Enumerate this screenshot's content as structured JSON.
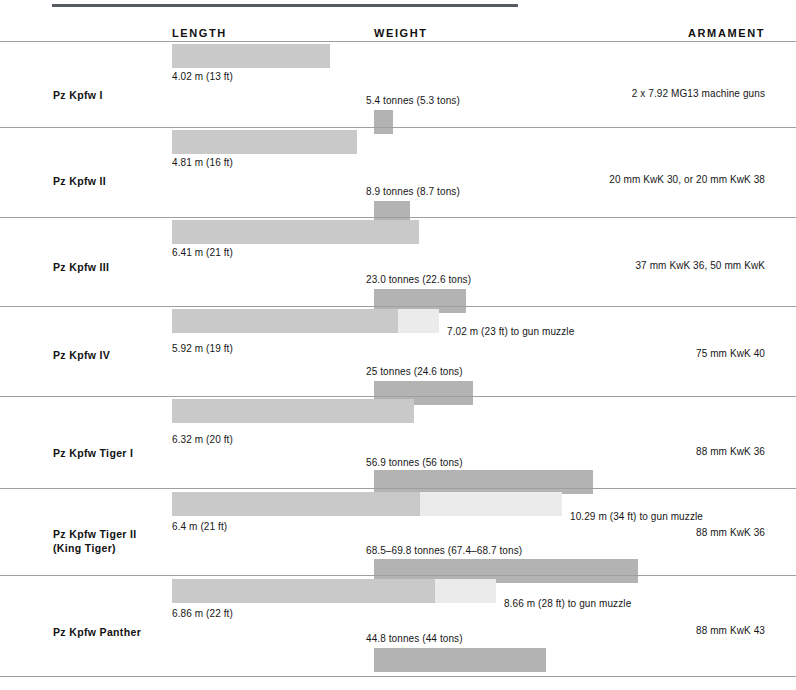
{
  "headers": {
    "length": "LENGTH",
    "weight": "WEIGHT",
    "armament": "ARMAMENT"
  },
  "chart_data": {
    "type": "bar",
    "title": "",
    "xlabel": "",
    "ylabel": "",
    "categories": [
      "Pz Kpfw I",
      "Pz Kpfw II",
      "Pz Kpfw III",
      "Pz Kpfw IV",
      "Pz Kpfw Tiger I",
      "Pz Kpfw Tiger II\n(King Tiger)",
      "Pz Kpfw Panther"
    ],
    "series": [
      {
        "name": "Length (m)",
        "values": [
          4.02,
          4.81,
          6.41,
          5.92,
          6.32,
          6.4,
          6.86
        ]
      },
      {
        "name": "Length to gun muzzle (m)",
        "values": [
          null,
          null,
          null,
          7.02,
          null,
          10.29,
          8.66
        ]
      },
      {
        "name": "Weight (tonnes)",
        "values": [
          5.4,
          8.9,
          23.0,
          25,
          56.9,
          69.15,
          44.8
        ]
      }
    ],
    "legend_position": "none",
    "grid": false
  },
  "rows": [
    {
      "name": "Pz Kpfw I",
      "length_label": "4.02 m (13 ft)",
      "length_ext_label": "",
      "weight_label": "5.4 tonnes (5.3 tons)",
      "armament": "2 x  7.92 MG13 machine guns"
    },
    {
      "name": "Pz Kpfw II",
      "length_label": "4.81 m (16 ft)",
      "length_ext_label": "",
      "weight_label": "8.9 tonnes (8.7 tons)",
      "armament": "20 mm KwK 30, or 20 mm KwK 38"
    },
    {
      "name": "Pz Kpfw III",
      "length_label": "6.41 m (21 ft)",
      "length_ext_label": "",
      "weight_label": "23.0 tonnes (22.6 tons)",
      "armament": "37 mm KwK 36, 50 mm KwK"
    },
    {
      "name": "Pz Kpfw IV",
      "length_label": "5.92 m (19 ft)",
      "length_ext_label": "7.02 m (23 ft) to gun muzzle",
      "weight_label": "25 tonnes (24.6 tons)",
      "armament": "75 mm KwK 40"
    },
    {
      "name": "Pz Kpfw Tiger I",
      "length_label": "6.32 m (20 ft)",
      "length_ext_label": "",
      "weight_label": "56.9 tonnes (56 tons)",
      "armament": "88 mm KwK 36"
    },
    {
      "name": "Pz Kpfw Tiger II\n(King Tiger)",
      "length_label": "6.4 m (21 ft)",
      "length_ext_label": "10.29 m (34 ft) to gun muzzle",
      "weight_label": "68.5–69.8 tonnes (67.4–68.7 tons)",
      "armament": "88 mm KwK 36"
    },
    {
      "name": "Pz Kpfw Panther",
      "length_label": "6.86 m (22 ft)",
      "length_ext_label": "8.66 m (28 ft) to gun muzzle",
      "weight_label": "44.8 tonnes (44 tons)",
      "armament": "88 mm KwK 43"
    }
  ],
  "colors": {
    "length_bar": "#c9c9c9",
    "length_ext_bar": "#ebebeb",
    "weight_bar": "#b3b3b3",
    "rule": "#9aa0a5",
    "top_rule": "#555b60"
  }
}
